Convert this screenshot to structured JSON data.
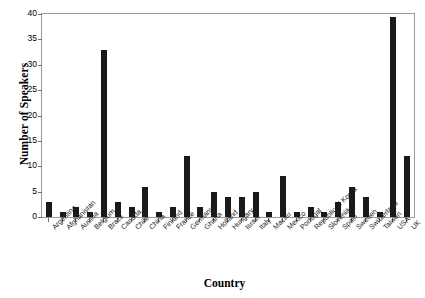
{
  "chart_data": {
    "type": "bar",
    "title": "",
    "xlabel": "Country",
    "ylabel": "Number of Speakers",
    "ylim": [
      0,
      40
    ],
    "ytick_labels": [
      "0",
      "5",
      "10",
      "15",
      "20",
      "25",
      "30",
      "35",
      "40"
    ],
    "ytick_values": [
      0,
      5,
      10,
      15,
      20,
      25,
      30,
      35,
      40
    ],
    "grid": false,
    "legend": null,
    "bar_color": "#1a1a1a",
    "categories": [
      "Argentina",
      "Afghanistan",
      "Austria",
      "Belgium",
      "Brazil",
      "Canada",
      "Chile",
      "China",
      "Finland",
      "France",
      "Germany",
      "Ghana",
      "Holland",
      "Hungary",
      "Israel",
      "Italy",
      "Macau",
      "Mexico",
      "Portugal",
      "Republic of Korea",
      "Slovenia",
      "Spain",
      "Sweden",
      "Switzerland",
      "Taiwan",
      "USA",
      "UK"
    ],
    "values": [
      3,
      1,
      2,
      1,
      33,
      3,
      2,
      6,
      1,
      2,
      12,
      2,
      5,
      4,
      4,
      5,
      1,
      8,
      1,
      2,
      1,
      3,
      6,
      4,
      1,
      39.5,
      12
    ]
  }
}
